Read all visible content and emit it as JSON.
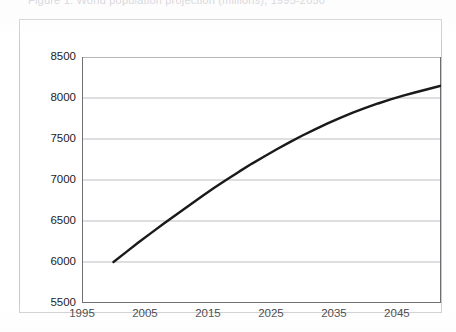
{
  "title": {
    "text": "Figure 1. World population projection (millions), 1995-2050",
    "visible_state": "cropped-at-top-edge"
  },
  "chart_data": {
    "type": "line",
    "title": "",
    "xlabel": "",
    "ylabel": "",
    "xlim": [
      1995,
      2052
    ],
    "ylim": [
      5500,
      8500
    ],
    "grid": true,
    "legend": false,
    "legend_position": "none",
    "line_color": "#1a1a1a",
    "line_width": 2.4,
    "x_ticks": [
      1995,
      2005,
      2015,
      2025,
      2035,
      2045
    ],
    "x_tick_labels": [
      "1995",
      "2005",
      "2015",
      "2025",
      "2035",
      "2045"
    ],
    "y_ticks": [
      5500,
      6000,
      6500,
      7000,
      7500,
      8000,
      8500
    ],
    "y_tick_labels": [
      "5500",
      "6000",
      "6500",
      "7000",
      "7500",
      "8000",
      "8500"
    ],
    "series": [
      {
        "name": "Population",
        "x": [
          2000,
          2002,
          2004,
          2006,
          2008,
          2010,
          2012,
          2014,
          2016,
          2018,
          2020,
          2022,
          2024,
          2026,
          2028,
          2030,
          2032,
          2034,
          2036,
          2038,
          2040,
          2042,
          2044,
          2046,
          2048,
          2050,
          2052
        ],
        "values": [
          6000,
          6120,
          6240,
          6355,
          6470,
          6580,
          6690,
          6800,
          6905,
          7005,
          7105,
          7200,
          7290,
          7378,
          7462,
          7542,
          7618,
          7690,
          7758,
          7822,
          7880,
          7933,
          7982,
          8028,
          8070,
          8110,
          8150
        ]
      }
    ]
  },
  "axes": {
    "y_labels": [
      "8500",
      "8000",
      "7500",
      "7000",
      "6500",
      "6000",
      "5500"
    ],
    "x_labels": [
      "1995",
      "2005",
      "2015",
      "2025",
      "2035",
      "2045"
    ]
  },
  "colors": {
    "line": "#1a1a1a",
    "gridline": "#b6b6bb",
    "axis": "#6e6e73",
    "frame": "#c9c9cd",
    "background": "#ffffff",
    "text": "#1c1c1c"
  }
}
